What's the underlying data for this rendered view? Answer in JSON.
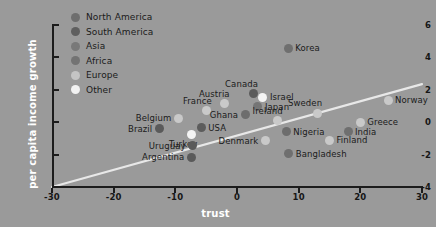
{
  "chart_data": {
    "type": "scatter",
    "title": "",
    "xlabel": "trust",
    "ylabel": "per capita income growth",
    "xlim": [
      -30,
      30
    ],
    "ylim": [
      -4,
      6
    ],
    "xticks": [
      "-30",
      "-20",
      "-10",
      "0",
      "10",
      "20",
      "30"
    ],
    "xtick_values": [
      -30,
      -20,
      -10,
      0,
      10,
      20,
      30
    ],
    "yticks": [
      "6",
      "4",
      "2",
      "0",
      "-2",
      "-4"
    ],
    "ytick_values": [
      6,
      4,
      2,
      0,
      -2,
      -4
    ],
    "grid": false,
    "legend_position": "top-left",
    "legend": [
      {
        "label": "North America",
        "color": "#6e6e6e"
      },
      {
        "label": "South America",
        "color": "#5f5f5f"
      },
      {
        "label": "Asia",
        "color": "#797979"
      },
      {
        "label": "Africa",
        "color": "#737373"
      },
      {
        "label": "Europe",
        "color": "#c4c4c4"
      },
      {
        "label": "Other",
        "color": "#f2f2f2"
      }
    ],
    "trendline": {
      "x0": -30,
      "y0": -4.0,
      "x1": 30,
      "y1": 2.35,
      "color": "#e8e8e8"
    },
    "points": [
      {
        "name": "Korea",
        "x": 8.3,
        "y": 4.55,
        "group": "Asia",
        "color": "#6f6f6f",
        "label_side": "right"
      },
      {
        "name": "Canada",
        "x": 2.6,
        "y": 1.75,
        "group": "North America",
        "color": "#5c5c5c",
        "label_side": "above"
      },
      {
        "name": "Israel",
        "x": 4.2,
        "y": 1.55,
        "group": "Other",
        "color": "#f4f4f4",
        "label_side": "right"
      },
      {
        "name": "Austria",
        "x": -2.0,
        "y": 1.15,
        "group": "Europe",
        "color": "#c9c9c9",
        "label_side": "above"
      },
      {
        "name": "Japan",
        "x": 3.4,
        "y": 0.95,
        "group": "Asia",
        "color": "#757575",
        "label_side": "right"
      },
      {
        "name": "France",
        "x": -4.9,
        "y": 0.7,
        "group": "Europe",
        "color": "#c9c9c9",
        "label_side": "above"
      },
      {
        "name": "Ghana",
        "x": 1.3,
        "y": 0.45,
        "group": "Africa",
        "color": "#6d6d6d",
        "label_side": "left"
      },
      {
        "name": "Sweden",
        "x": 13.0,
        "y": 0.55,
        "group": "Europe",
        "color": "#c9c9c9",
        "label_side": "above"
      },
      {
        "name": "Norway",
        "x": 24.5,
        "y": 1.35,
        "group": "Europe",
        "color": "#c9c9c9",
        "label_side": "right"
      },
      {
        "name": "Belgium",
        "x": -9.5,
        "y": 0.25,
        "group": "Europe",
        "color": "#c9c9c9",
        "label_side": "left"
      },
      {
        "name": "Ireland",
        "x": 6.6,
        "y": 0.1,
        "group": "Europe",
        "color": "#c9c9c9",
        "label_side": "above"
      },
      {
        "name": "Greece",
        "x": 20.0,
        "y": 0.0,
        "group": "Europe",
        "color": "#c9c9c9",
        "label_side": "right"
      },
      {
        "name": "Brazil",
        "x": -12.6,
        "y": -0.4,
        "group": "South America",
        "color": "#5a5a5a",
        "label_side": "left"
      },
      {
        "name": "USA",
        "x": -5.8,
        "y": -0.35,
        "group": "North America",
        "color": "#5c5c5c",
        "label_side": "right"
      },
      {
        "name": "Turkey",
        "x": -7.4,
        "y": -0.75,
        "group": "Other",
        "color": "#f4f4f4",
        "label_side": "below"
      },
      {
        "name": "Nigeria",
        "x": 8.0,
        "y": -0.6,
        "group": "Africa",
        "color": "#6d6d6d",
        "label_side": "right"
      },
      {
        "name": "India",
        "x": 18.0,
        "y": -0.6,
        "group": "Asia",
        "color": "#6f6f6f",
        "label_side": "right"
      },
      {
        "name": "Denmark",
        "x": 4.6,
        "y": -1.15,
        "group": "Europe",
        "color": "#c9c9c9",
        "label_side": "left"
      },
      {
        "name": "Finland",
        "x": 15.0,
        "y": -1.1,
        "group": "Europe",
        "color": "#c9c9c9",
        "label_side": "right"
      },
      {
        "name": "Uruguay",
        "x": -7.2,
        "y": -1.45,
        "group": "South America",
        "color": "#5a5a5a",
        "label_side": "left"
      },
      {
        "name": "Argentina",
        "x": -7.4,
        "y": -2.15,
        "group": "South America",
        "color": "#5a5a5a",
        "label_side": "left"
      },
      {
        "name": "Bangladesh",
        "x": 8.4,
        "y": -1.95,
        "group": "Asia",
        "color": "#6f6f6f",
        "label_side": "right"
      }
    ]
  },
  "colors": {
    "background": "#9a9a9a",
    "axis": "#1c1c1c",
    "axis_title": "#ffffff",
    "tick_label": "#161616",
    "point_label": "#1a1a1a",
    "trendline": "#e8e8e8"
  }
}
